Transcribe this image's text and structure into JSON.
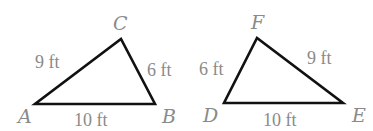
{
  "triangles": [
    {
      "name": "ABC",
      "vertices": {
        "A": {
          "label": "A",
          "x": 35,
          "y": 104
        },
        "B": {
          "label": "B",
          "x": 155,
          "y": 104
        },
        "C": {
          "label": "C",
          "x": 121,
          "y": 39
        }
      },
      "sides": {
        "AC": "9 ft",
        "CB": "6 ft",
        "AB": "10 ft"
      }
    },
    {
      "name": "DEF",
      "vertices": {
        "D": {
          "label": "D",
          "x": 224,
          "y": 103
        },
        "E": {
          "label": "E",
          "x": 343,
          "y": 103
        },
        "F": {
          "label": "F",
          "x": 257,
          "y": 38
        }
      },
      "sides": {
        "DF": "6 ft",
        "FE": "9 ft",
        "DE": "10 ft"
      }
    }
  ],
  "colors": {
    "edge": "#111111",
    "label": "#8a8a8a",
    "background": "#ffffff"
  }
}
